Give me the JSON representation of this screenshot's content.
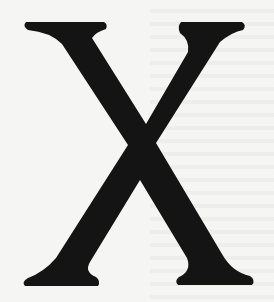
{
  "image": {
    "description": "Large serif capital letter drop-cap on a paper background with faint show-through text",
    "glyph": "X",
    "glyph_color": "#141414",
    "background_color": "#f5f5f3"
  }
}
